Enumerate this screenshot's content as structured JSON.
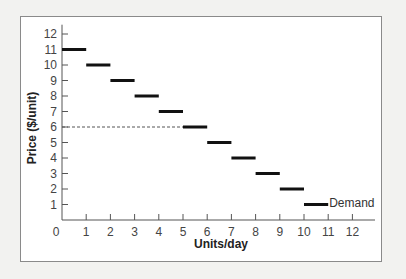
{
  "chart_data": {
    "type": "line",
    "subtype": "step-demand",
    "title": "",
    "xlabel": "Units/day",
    "ylabel": "Price ($/unit)",
    "xlim": [
      0,
      12
    ],
    "ylim": [
      0,
      12
    ],
    "x_ticks": [
      "0",
      "1",
      "2",
      "3",
      "4",
      "5",
      "6",
      "7",
      "8",
      "9",
      "10",
      "11",
      "12"
    ],
    "y_ticks": [
      "1",
      "2",
      "3",
      "4",
      "5",
      "6",
      "7",
      "8",
      "9",
      "10",
      "11",
      "12"
    ],
    "grid": false,
    "series": [
      {
        "name": "Demand",
        "segments": [
          {
            "x0": 0,
            "x1": 1,
            "y": 11
          },
          {
            "x0": 1,
            "x1": 2,
            "y": 10
          },
          {
            "x0": 2,
            "x1": 3,
            "y": 9
          },
          {
            "x0": 3,
            "x1": 4,
            "y": 8
          },
          {
            "x0": 4,
            "x1": 5,
            "y": 7
          },
          {
            "x0": 5,
            "x1": 6,
            "y": 6
          },
          {
            "x0": 6,
            "x1": 7,
            "y": 5
          },
          {
            "x0": 7,
            "x1": 8,
            "y": 4
          },
          {
            "x0": 8,
            "x1": 9,
            "y": 3
          },
          {
            "x0": 9,
            "x1": 10,
            "y": 2
          },
          {
            "x0": 10,
            "x1": 11,
            "y": 1
          }
        ]
      }
    ],
    "annotations": [
      {
        "type": "dashed-hline",
        "y": 6,
        "x_from": 0,
        "x_to": 5
      },
      {
        "type": "label",
        "text": "Demand",
        "x": 11,
        "y": 1
      }
    ]
  }
}
